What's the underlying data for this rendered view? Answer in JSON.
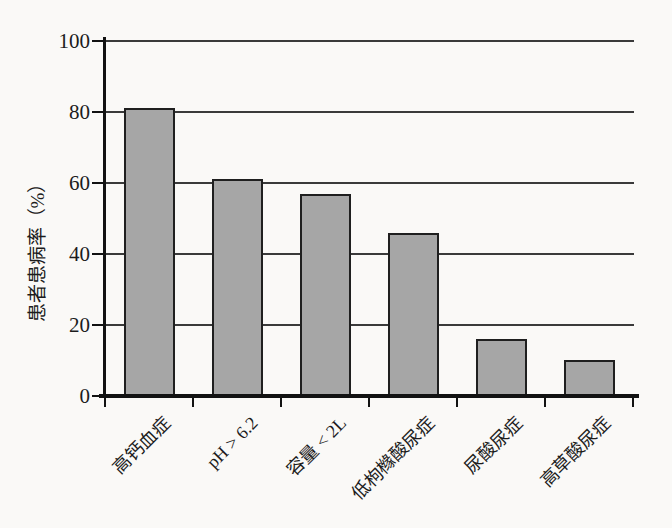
{
  "chart_data": {
    "type": "bar",
    "title": "",
    "categories": [
      "高钙血症",
      "pH > 6.2",
      "容量 < 2L",
      "低枸橼酸尿症",
      "尿酸尿症",
      "高草酸尿症"
    ],
    "values": [
      81,
      61,
      57,
      46,
      16,
      10
    ],
    "xlabel": "",
    "ylabel": "患者患病率（%）",
    "yticks": [
      0,
      20,
      40,
      60,
      80,
      100
    ],
    "ylim": [
      0,
      100
    ],
    "grid": true,
    "legend": false,
    "bar_fill": "#a6a6a6",
    "bar_border": "#1f1f1f",
    "axis_color": "#121212",
    "gridline_color": "#3a3a3a",
    "background": "#faf9f7"
  }
}
